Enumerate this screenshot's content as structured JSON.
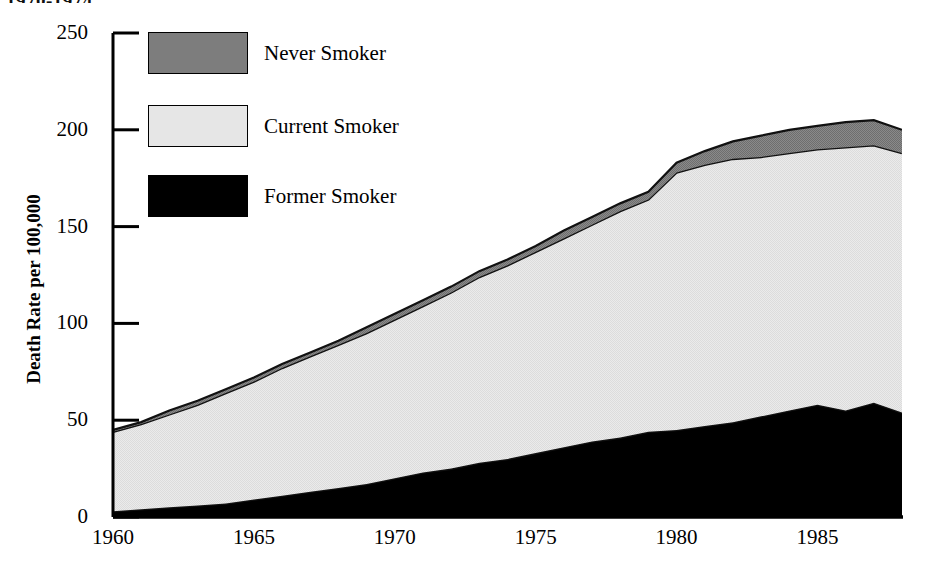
{
  "header": {
    "clipped_top_text": "1970-1974"
  },
  "chart_data": {
    "type": "area",
    "stacked": true,
    "title": "",
    "subtitle": "",
    "xlabel": "",
    "ylabel": "Death Rate per 100,000",
    "xlim": [
      1960,
      1988
    ],
    "ylim": [
      0,
      250
    ],
    "grid": false,
    "legend_position": "upper-left",
    "x_ticks": [
      1960,
      1965,
      1970,
      1975,
      1980,
      1985
    ],
    "x_tick_labels": [
      "1960",
      "1965",
      "1970",
      "1975",
      "1980",
      "1985"
    ],
    "y_ticks": [
      0,
      50,
      100,
      150,
      200,
      250
    ],
    "y_tick_labels": [
      "0",
      "50",
      "100",
      "150",
      "200",
      "250"
    ],
    "x": [
      1960,
      1961,
      1962,
      1963,
      1964,
      1965,
      1966,
      1967,
      1968,
      1969,
      1970,
      1971,
      1972,
      1973,
      1974,
      1975,
      1976,
      1977,
      1978,
      1979,
      1980,
      1981,
      1982,
      1983,
      1984,
      1985,
      1986,
      1987,
      1988
    ],
    "stack_order": [
      "Former Smoker",
      "Current Smoker",
      "Never Smoker"
    ],
    "series": [
      {
        "name": "Former Smoker",
        "color": "#000000",
        "values": [
          3,
          4,
          5,
          6,
          7,
          9,
          11,
          13,
          15,
          17,
          20,
          23,
          25,
          28,
          30,
          33,
          36,
          39,
          41,
          44,
          45,
          47,
          49,
          52,
          55,
          58,
          55,
          59,
          54
        ]
      },
      {
        "name": "Current Smoker",
        "color": "#e6e6e6",
        "values": [
          41,
          44,
          48,
          52,
          57,
          61,
          66,
          70,
          74,
          78,
          82,
          86,
          91,
          96,
          100,
          104,
          108,
          112,
          117,
          120,
          133,
          135,
          136,
          134,
          133,
          132,
          136,
          133,
          134
        ]
      },
      {
        "name": "Never Smoker",
        "color": "#7d7d7d",
        "values": [
          1,
          1,
          2,
          2,
          2,
          2,
          2,
          2,
          2,
          3,
          3,
          3,
          3,
          3,
          3,
          3,
          4,
          4,
          4,
          4,
          5,
          7,
          9,
          11,
          12,
          12,
          13,
          13,
          12
        ]
      }
    ],
    "totals": [
      45,
      49,
      55,
      60,
      66,
      72,
      79,
      85,
      91,
      98,
      105,
      112,
      119,
      127,
      133,
      140,
      148,
      155,
      162,
      168,
      183,
      189,
      194,
      197,
      200,
      202,
      204,
      205,
      200
    ]
  },
  "legend": {
    "items": [
      {
        "label": "Never Smoker",
        "swatch_class": "sw-never",
        "swatch_name": "legend-swatch-never-smoker",
        "color": "#7d7d7d"
      },
      {
        "label": "Current Smoker",
        "swatch_class": "sw-current",
        "swatch_name": "legend-swatch-current-smoker",
        "color": "#e6e6e6"
      },
      {
        "label": "Former Smoker",
        "swatch_class": "sw-former",
        "swatch_name": "legend-swatch-former-smoker",
        "color": "#000000"
      }
    ]
  },
  "axes": {
    "y_title": "Death Rate per 100,000"
  }
}
